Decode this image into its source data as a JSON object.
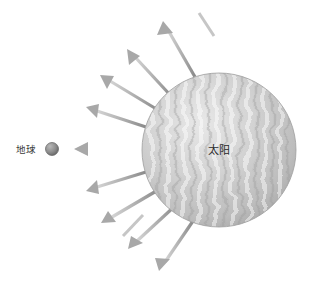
{
  "diagram": {
    "background_color": "#ffffff",
    "sun": {
      "label": "太阳",
      "label_x": 219,
      "label_y": 154,
      "center_x": 219,
      "center_y": 150,
      "radius": 77,
      "fill_light": "#e3e3e3",
      "fill_mid": "#c9c9c9",
      "fill_dark": "#a8a8a8",
      "edge_color": "#9a9a9a"
    },
    "earth": {
      "label": "地球",
      "label_x": 16,
      "label_y": 153,
      "center_x": 52,
      "center_y": 149,
      "radius": 6,
      "fill_light": "#b8b8b8",
      "fill_dark": "#6f6f6f"
    },
    "rays": {
      "color_tail": "#8f8f8f",
      "color_head": "#cfcfcf",
      "head_fill": "#a5a5a5",
      "shaft_width": 3.2,
      "head_length": 13,
      "head_width": 12,
      "count": 11,
      "items": [
        {
          "name": "ray-up-right",
          "angle_deg": -72,
          "tail_r": 78,
          "length": 62,
          "head_x": 163,
          "head_y": 22
        },
        {
          "name": "ray-up",
          "angle_deg": -108,
          "tail_r": 78,
          "length": 63,
          "head_x": 128,
          "head_y": 50
        },
        {
          "name": "ray-up-left-steep",
          "angle_deg": -140,
          "tail_r": 78,
          "length": 62,
          "head_x": 101,
          "head_y": 75
        },
        {
          "name": "ray-up-left",
          "angle_deg": -160,
          "tail_r": 78,
          "length": 62,
          "head_x": 88,
          "head_y": 108
        },
        {
          "name": "ray-left-to-earth",
          "angle_deg": 180,
          "tail_r": 78,
          "length": 66,
          "head_x": 76,
          "head_y": 149
        },
        {
          "name": "ray-down-left",
          "angle_deg": 160,
          "tail_r": 78,
          "length": 62,
          "head_x": 88,
          "head_y": 189
        },
        {
          "name": "ray-down-left-steep",
          "angle_deg": 140,
          "tail_r": 78,
          "length": 62,
          "head_x": 103,
          "head_y": 222
        },
        {
          "name": "ray-down",
          "angle_deg": 115,
          "tail_r": 78,
          "length": 62,
          "head_x": 130,
          "head_y": 248
        },
        {
          "name": "ray-down-right",
          "angle_deg": 80,
          "tail_r": 78,
          "length": 62,
          "head_x": 160,
          "head_y": 270
        },
        {
          "name": "ray-up-right-outer",
          "angle_deg": -58,
          "tail_r": 78,
          "length": 24,
          "head_x": 196,
          "head_y": 12
        },
        {
          "name": "ray-down-left-outer",
          "angle_deg": 128,
          "tail_r": 78,
          "length": 24,
          "head_x": 120,
          "head_y": 236
        }
      ]
    }
  }
}
